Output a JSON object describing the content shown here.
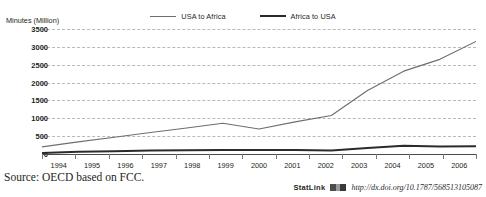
{
  "top_cropped_text": "",
  "yaxis_title": "Minutes (Million)",
  "legend": [
    {
      "label": "USA to Africa",
      "style": "thin",
      "color": "#6e6e6e"
    },
    {
      "label": "Africa to USA",
      "style": "thick",
      "color": "#2b2b2b"
    }
  ],
  "source": "Source: OECD based on FCC.",
  "statlink": {
    "word": "StatLink",
    "url": "http://dx.doi.org/10.1787/568513105087"
  },
  "chart_data": {
    "type": "line",
    "title": "",
    "xlabel": "",
    "ylabel": "Minutes (Million)",
    "categories": [
      "1994",
      "1995",
      "1996",
      "1997",
      "1998",
      "1999",
      "2000",
      "2001",
      "2002",
      "2003",
      "2004",
      "2005",
      "2006"
    ],
    "ylim": [
      0,
      3500
    ],
    "yticks": [
      0,
      500,
      1000,
      1500,
      2000,
      2500,
      3000,
      3500
    ],
    "grid": true,
    "legend_position": "top-center",
    "series": [
      {
        "name": "USA to Africa",
        "color": "#6e6e6e",
        "width": 1.1,
        "values": [
          200,
          340,
          470,
          600,
          730,
          860,
          700,
          900,
          1080,
          1780,
          2320,
          2650,
          3150
        ]
      },
      {
        "name": "Africa to USA",
        "color": "#2b2b2b",
        "width": 2.0,
        "values": [
          30,
          60,
          80,
          95,
          105,
          110,
          115,
          110,
          95,
          170,
          230,
          210,
          215
        ]
      }
    ]
  }
}
